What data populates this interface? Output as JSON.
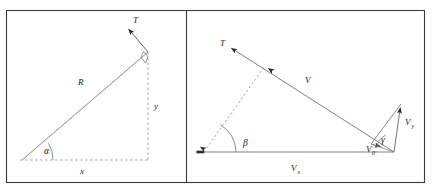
{
  "figure": {
    "type": "two-panel-vector-diagram",
    "background_color": "#ffffff",
    "frame_color": "#3a3a3a",
    "line_color": "#6b6b6b",
    "label_color": "#1a1a1a",
    "panels": [
      {
        "id": "left-panel",
        "name": "displacement-triangle",
        "description": "Right triangle with hypotenuse R at angle alpha above horizontal leg x, vertical leg y, and tension vector T perpendicular to R at the apex.",
        "labels": {
          "hypotenuse": "R",
          "angle": "α",
          "horizontal_leg": "x",
          "vertical_leg": "y",
          "vector": "T"
        },
        "geometry": {
          "origin": [
            22,
            160
          ],
          "apex": [
            148,
            52
          ],
          "corner": [
            148,
            160
          ],
          "t_arrow_tip": [
            126,
            26
          ],
          "right_angle_at": "apex"
        }
      },
      {
        "id": "right-panel",
        "name": "velocity-triangle",
        "description": "Velocity vector V directed up-left labelled T at its tip, horizontal component Vx along the base, resultant V0 with vertical component Vy at the right vertex, angle beta at left vertex and angle gamma at right vertex.",
        "labels": {
          "vector_tip": "T",
          "resultant": "V",
          "horizontal_component": "V",
          "horizontal_component_sub": "x",
          "vertical_component": "V",
          "vertical_component_sub": "y",
          "initial_velocity": "V",
          "initial_velocity_sub": "0",
          "angle_left": "β",
          "angle_right": "γ"
        },
        "geometry": {
          "left_vertex": [
            204,
            152
          ],
          "right_vertex": [
            394,
            152
          ],
          "v_tip": [
            228,
            46
          ],
          "vy_top": [
            401,
            104
          ],
          "v0_point": [
            372,
            143
          ]
        }
      }
    ]
  }
}
